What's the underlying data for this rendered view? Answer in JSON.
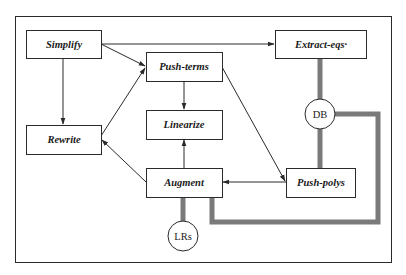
{
  "diagram": {
    "type": "flow-diagram",
    "nodes": [
      {
        "id": "simplify",
        "label": "Simplify",
        "x": 26,
        "y": 30,
        "w": 75,
        "h": 28
      },
      {
        "id": "extract_eqs",
        "label": "Extract-eqs·",
        "x": 275,
        "y": 30,
        "w": 91,
        "h": 28
      },
      {
        "id": "push_terms",
        "label": "Push-terms",
        "x": 146,
        "y": 52,
        "w": 76,
        "h": 29
      },
      {
        "id": "linearize",
        "label": "Linearize",
        "x": 146,
        "y": 110,
        "w": 76,
        "h": 29
      },
      {
        "id": "rewrite",
        "label": "Rewrite",
        "x": 26,
        "y": 125,
        "w": 75,
        "h": 29
      },
      {
        "id": "augment",
        "label": "Augment",
        "x": 146,
        "y": 168,
        "w": 76,
        "h": 29
      },
      {
        "id": "push_polys",
        "label": "Push-polys",
        "x": 286,
        "y": 168,
        "w": 69,
        "h": 29
      }
    ],
    "stores": [
      {
        "id": "db",
        "label": "DB",
        "cx": 320,
        "cy": 114,
        "r": 15
      },
      {
        "id": "lrs",
        "label": "LRs",
        "cx": 183,
        "cy": 236,
        "r": 15
      }
    ],
    "edges": [
      {
        "from": "simplify",
        "to": "extract_eqs"
      },
      {
        "from": "simplify",
        "to": "push_terms"
      },
      {
        "from": "simplify",
        "to": "rewrite"
      },
      {
        "from": "rewrite",
        "to": "push_terms"
      },
      {
        "from": "push_terms",
        "to": "linearize"
      },
      {
        "from": "push_terms",
        "to": "push_polys"
      },
      {
        "from": "augment",
        "to": "linearize"
      },
      {
        "from": "augment",
        "to": "rewrite"
      },
      {
        "from": "push_polys",
        "to": "augment"
      }
    ],
    "data_links": [
      {
        "from": "extract_eqs",
        "to": "db"
      },
      {
        "from": "db",
        "to": "push_polys"
      },
      {
        "from": "db",
        "to": "augment"
      },
      {
        "from": "augment",
        "to": "lrs"
      }
    ],
    "colors": {
      "line": "#2a2a2a",
      "data_link": "#7a7a7a",
      "background": "#ffffff"
    }
  }
}
